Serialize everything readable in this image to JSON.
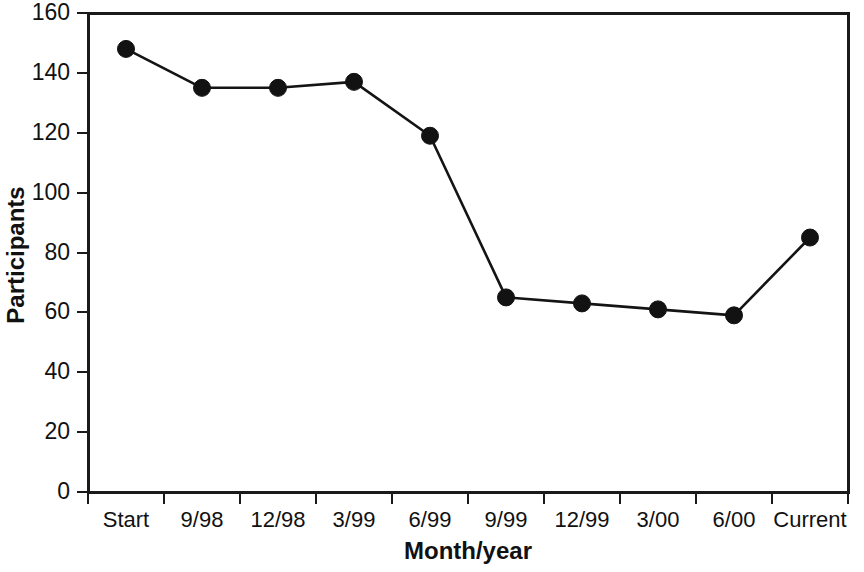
{
  "chart_data": {
    "type": "line",
    "title": "",
    "xlabel": "Month/year",
    "ylabel": "Participants",
    "categories": [
      "Start",
      "9/98",
      "12/98",
      "3/99",
      "6/99",
      "9/99",
      "12/99",
      "3/00",
      "6/00",
      "Current"
    ],
    "values": [
      148,
      135,
      135,
      137,
      119,
      65,
      63,
      61,
      59,
      85
    ],
    "series": [
      {
        "name": "Participants",
        "values": [
          148,
          135,
          135,
          137,
          119,
          65,
          63,
          61,
          59,
          85
        ]
      }
    ],
    "ylim": [
      0,
      160
    ],
    "ytick_labels": [
      "0",
      "20",
      "40",
      "60",
      "80",
      "100",
      "120",
      "140",
      "160"
    ],
    "ytick_values": [
      0,
      20,
      40,
      60,
      80,
      100,
      120,
      140,
      160
    ],
    "grid": false,
    "legend": false,
    "legend_position": "none",
    "marker": "filled-circle",
    "line_color": "#141414",
    "marker_color": "#121212",
    "axis_color": "#1a1a1a",
    "background": "#ffffff"
  }
}
